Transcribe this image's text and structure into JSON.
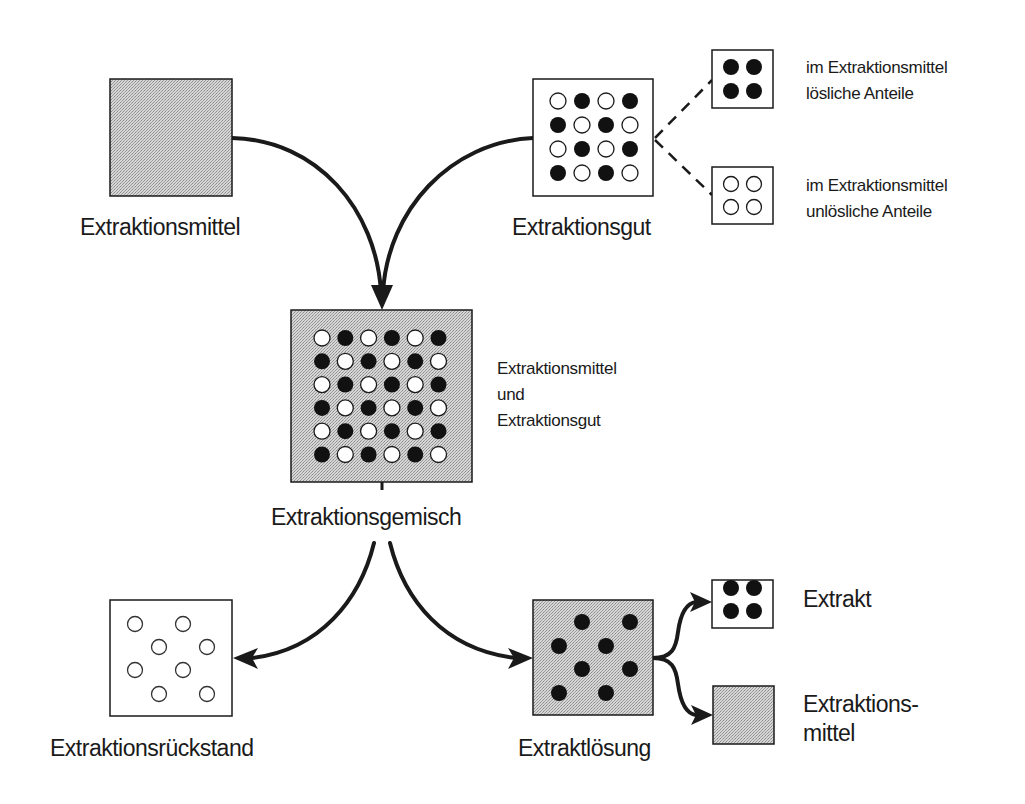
{
  "colors": {
    "stroke": "#1a1a1a",
    "gray_fill": "#c9c9c9",
    "white_fill": "#ffffff",
    "dot_black": "#111111"
  },
  "nodes": {
    "solvent": {
      "label": "Extraktionsmittel",
      "fill": "gray"
    },
    "feed": {
      "label": "Extraktionsgut",
      "fill": "white",
      "grid": [
        [
          "o",
          "x",
          "o",
          "x"
        ],
        [
          "x",
          "o",
          "x",
          "o"
        ],
        [
          "o",
          "x",
          "o",
          "x"
        ],
        [
          "x",
          "o",
          "x",
          "o"
        ]
      ]
    },
    "soluble": {
      "line1": "im Extraktionsmittel",
      "line2": "lösliche Anteile",
      "dots": "black"
    },
    "insoluble": {
      "line1": "im Extraktionsmittel",
      "line2": "unlösliche Anteile",
      "dots": "white"
    },
    "mixture": {
      "label": "Extraktionsgemisch",
      "note_line1": "Extraktionsmittel",
      "note_line2": "und",
      "note_line3": "Extraktionsgut",
      "fill": "gray",
      "grid": [
        [
          "o",
          "x",
          "o",
          "x",
          "o",
          "x"
        ],
        [
          "x",
          "o",
          "x",
          "o",
          "x",
          "o"
        ],
        [
          "o",
          "x",
          "o",
          "x",
          "o",
          "x"
        ],
        [
          "x",
          "o",
          "x",
          "o",
          "x",
          "o"
        ],
        [
          "o",
          "x",
          "o",
          "x",
          "o",
          "x"
        ],
        [
          "x",
          "o",
          "x",
          "o",
          "x",
          "o"
        ]
      ]
    },
    "residue": {
      "label": "Extraktionsrückstand",
      "fill": "white",
      "dots": "white-scattered"
    },
    "extract_solution": {
      "label": "Extraktlösung",
      "fill": "gray",
      "dots": "black-scattered"
    },
    "extract": {
      "label": "Extrakt",
      "fill": "white",
      "dots": "black"
    },
    "recovered_solvent": {
      "line1": "Extraktions-",
      "line2": "mittel",
      "fill": "gray"
    }
  },
  "edges": [
    {
      "from": "Extraktionsmittel",
      "to": "Extraktionsgemisch",
      "style": "solid-arrow"
    },
    {
      "from": "Extraktionsgut",
      "to": "Extraktionsgemisch",
      "style": "solid-arrow"
    },
    {
      "from": "Extraktionsgut",
      "to": "im Extraktionsmittel lösliche Anteile",
      "style": "dashed"
    },
    {
      "from": "Extraktionsgut",
      "to": "im Extraktionsmittel unlösliche Anteile",
      "style": "dashed"
    },
    {
      "from": "Extraktionsgemisch",
      "to": "Extraktionsrückstand",
      "style": "solid-arrow"
    },
    {
      "from": "Extraktionsgemisch",
      "to": "Extraktlösung",
      "style": "solid-arrow"
    },
    {
      "from": "Extraktlösung",
      "to": "Extrakt",
      "style": "solid-arrow"
    },
    {
      "from": "Extraktlösung",
      "to": "Extraktionsmittel",
      "style": "solid-arrow"
    }
  ]
}
